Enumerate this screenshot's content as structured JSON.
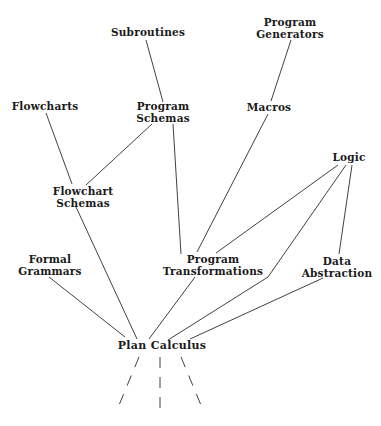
{
  "diagram": {
    "type": "lineage-graph",
    "nodes": {
      "subroutines": {
        "lines": [
          "Subroutines"
        ]
      },
      "program_generators": {
        "lines": [
          "Program",
          "Generators"
        ]
      },
      "flowcharts": {
        "lines": [
          "Flowcharts"
        ]
      },
      "program_schemas": {
        "lines": [
          "Program",
          "Schemas"
        ]
      },
      "macros": {
        "lines": [
          "Macros"
        ]
      },
      "logic": {
        "lines": [
          "Logic"
        ]
      },
      "flowchart_schemas": {
        "lines": [
          "Flowchart",
          "Schemas"
        ]
      },
      "formal_grammars": {
        "lines": [
          "Formal",
          "Grammars"
        ]
      },
      "program_transformations": {
        "lines": [
          "Program",
          "Transformations"
        ]
      },
      "data_abstraction": {
        "lines": [
          "Data",
          "Abstraction"
        ]
      },
      "plan_calculus": {
        "lines": [
          "Plan Calculus"
        ]
      }
    },
    "edges": [
      {
        "from": "Subroutines",
        "to": "Program Schemas"
      },
      {
        "from": "Program Generators",
        "to": "Macros"
      },
      {
        "from": "Flowcharts",
        "to": "Flowchart Schemas"
      },
      {
        "from": "Program Schemas",
        "to": "Flowchart Schemas"
      },
      {
        "from": "Program Schemas",
        "to": "Program Transformations"
      },
      {
        "from": "Macros",
        "to": "Program Transformations"
      },
      {
        "from": "Logic",
        "to": "Program Transformations"
      },
      {
        "from": "Logic",
        "to": "Plan Calculus"
      },
      {
        "from": "Logic",
        "to": "Data Abstraction"
      },
      {
        "from": "Flowchart Schemas",
        "to": "Plan Calculus"
      },
      {
        "from": "Formal Grammars",
        "to": "Plan Calculus"
      },
      {
        "from": "Program Transformations",
        "to": "Plan Calculus"
      },
      {
        "from": "Data Abstraction",
        "to": "Plan Calculus"
      }
    ],
    "continuation": {
      "style": "dashed",
      "count": 3,
      "from": "Plan Calculus"
    },
    "colors": {
      "line": "#2a2a2a",
      "text": "#1a1a1a",
      "background": "#ffffff"
    }
  }
}
